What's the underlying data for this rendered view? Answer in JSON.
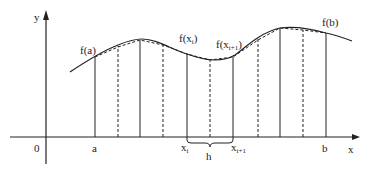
{
  "diagram": {
    "axes": {
      "x_label": "x",
      "y_label": "y",
      "origin_label": "0"
    },
    "x_ticks": {
      "a": "a",
      "xi_base": "x",
      "xi_sub": "i",
      "xi1_base": "x",
      "xi1_sub": "i+1",
      "b": "b"
    },
    "point_labels": {
      "fa": "f(a)",
      "fxi_prefix": "f(x",
      "fxi_sub": "i",
      "fxi_suffix": ")",
      "fxi1_prefix": "f(x",
      "fxi1_sub": "i+1",
      "fxi1_suffix": ")",
      "fb": "f(b)"
    },
    "step_label": "h",
    "colors": {
      "ink": "#222222",
      "background": "#ffffff"
    }
  }
}
